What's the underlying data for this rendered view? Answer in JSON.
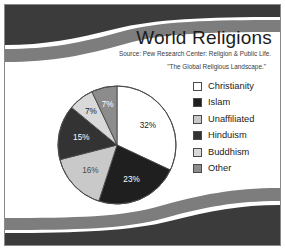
{
  "slide": {
    "title": "World Religions",
    "source_line_1": "Source: Pew Research Center: Religion & Public Life.",
    "source_line_2": "\"The Global Religious Landscape.\""
  },
  "colors": {
    "band_dark": "#3b3b3b",
    "band_gray": "#7d7d7d",
    "frame_border": "#8a8a8a",
    "slide_background": "#ffffff",
    "text": "#1c1c1c",
    "pie_outline": "#4a4a4a"
  },
  "legend": {
    "items": [
      {
        "label": "Christianity",
        "color": "#ffffff"
      },
      {
        "label": "Islam",
        "color": "#1f1f1f"
      },
      {
        "label": "Unaffiliated",
        "color": "#c9c9c9"
      },
      {
        "label": "Hinduism",
        "color": "#333333"
      },
      {
        "label": "Buddhism",
        "color": "#d9d9d9"
      },
      {
        "label": "Other",
        "color": "#8c8c8c"
      }
    ]
  },
  "chart_data": {
    "type": "pie",
    "title": "World Religions",
    "subtitle": "Source: Pew Research Center: Religion & Public Life. \"The Global Religious Landscape.\"",
    "categories": [
      "Christianity",
      "Islam",
      "Unaffiliated",
      "Hinduism",
      "Buddhism",
      "Other"
    ],
    "values": [
      32,
      23,
      16,
      15,
      7,
      7
    ],
    "unit": "%",
    "labels": [
      "32%",
      "23%",
      "16%",
      "15%",
      "7%",
      "7%"
    ],
    "colors": [
      "#ffffff",
      "#1f1f1f",
      "#c9c9c9",
      "#333333",
      "#d9d9d9",
      "#8c8c8c"
    ],
    "label_colors": [
      "#1c1c1c",
      "#ffffff",
      "#4a4a4a",
      "#ffffff",
      "#1c1c1c",
      "#ffffff"
    ],
    "start_angle_deg": 0,
    "direction": "clockwise",
    "legend_position": "right",
    "grid": false
  }
}
